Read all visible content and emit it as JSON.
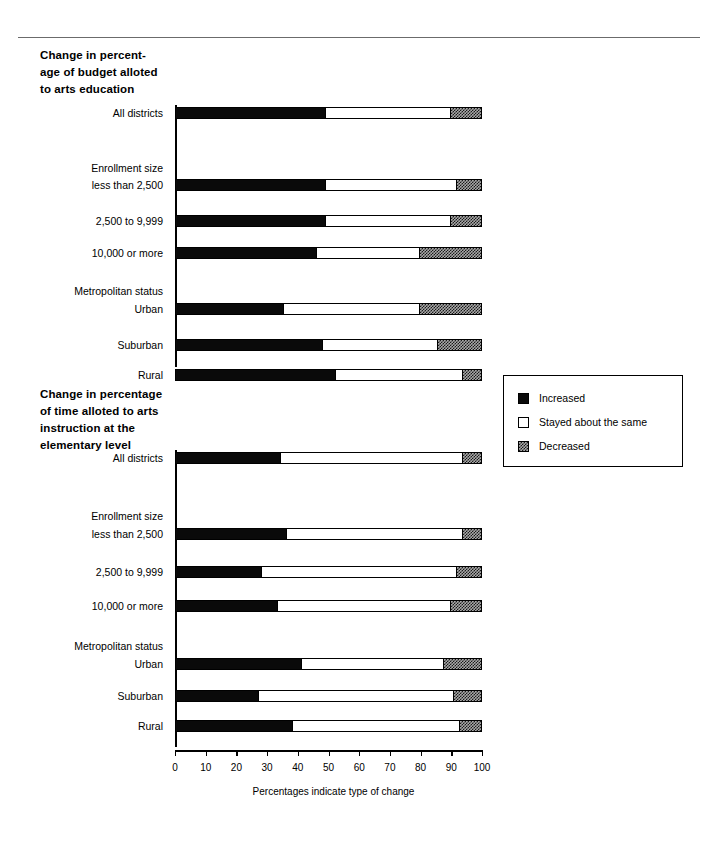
{
  "figure": {
    "xaxis_caption": "Percentages indicate type of change",
    "colors": {
      "increased": "#0a0a0a",
      "stayed": "#ffffff",
      "decreased": "#a8a8a8"
    }
  },
  "legend": {
    "items": [
      {
        "label": "Increased",
        "swatch": "black-square-swatch"
      },
      {
        "label": "Stayed about the same",
        "swatch": "white-square-swatch"
      },
      {
        "label": "Decreased",
        "swatch": "checkered-square-swatch"
      }
    ]
  },
  "chart_data": [
    {
      "type": "bar",
      "orientation": "horizontal",
      "stacked": true,
      "title": "Change in percent-\nage of budget alloted\nto arts education",
      "xlabel": "Percentages indicate type of change",
      "ylabel": "",
      "xlim": [
        0,
        100
      ],
      "xticks": [
        0,
        10,
        20,
        30,
        40,
        50,
        60,
        70,
        80,
        90,
        100
      ],
      "xticklabels": [
        "0",
        "10",
        "20",
        "30",
        "40",
        "50",
        "60",
        "70",
        "80",
        "90",
        "100"
      ],
      "grid": false,
      "legend_position": "right",
      "categories": [
        "All districts",
        "Enrollment size",
        "less than 2,500",
        "2,500 to 9,999",
        "10,000 or more",
        "Metropolitan status",
        "Urban",
        "Suburban",
        "Rural"
      ],
      "group_headers": [
        "Enrollment size",
        "Metropolitan status"
      ],
      "series": [
        {
          "name": "Increased",
          "values": [
            49,
            null,
            49,
            49,
            46,
            null,
            35,
            48,
            52
          ]
        },
        {
          "name": "Stayed about the same",
          "values": [
            41,
            null,
            43,
            41,
            34,
            null,
            45,
            38,
            42
          ]
        },
        {
          "name": "Decreased",
          "values": [
            10,
            null,
            8,
            10,
            20,
            null,
            20,
            14,
            6
          ]
        }
      ]
    },
    {
      "type": "bar",
      "orientation": "horizontal",
      "stacked": true,
      "title": "Change in percentage\nof time alloted to arts\ninstruction at the\nelementary level",
      "xlabel": "Percentages indicate type of change",
      "ylabel": "",
      "xlim": [
        0,
        100
      ],
      "xticks": [
        0,
        10,
        20,
        30,
        40,
        50,
        60,
        70,
        80,
        90,
        100
      ],
      "xticklabels": [
        "0",
        "10",
        "20",
        "30",
        "40",
        "50",
        "60",
        "70",
        "80",
        "90",
        "100"
      ],
      "grid": false,
      "legend_position": "right",
      "categories": [
        "All districts",
        "Enrollment size",
        "less than 2,500",
        "2,500 to 9,999",
        "10,000 or more",
        "Metropolitan status",
        "Urban",
        "Suburban",
        "Rural"
      ],
      "group_headers": [
        "Enrollment size",
        "Metropolitan status"
      ],
      "series": [
        {
          "name": "Increased",
          "values": [
            34,
            null,
            36,
            28,
            33,
            null,
            41,
            27,
            38
          ]
        },
        {
          "name": "Stayed about the same",
          "values": [
            60,
            null,
            58,
            64,
            57,
            null,
            47,
            64,
            55
          ]
        },
        {
          "name": "Decreased",
          "values": [
            6,
            null,
            6,
            8,
            10,
            null,
            12,
            9,
            7
          ]
        }
      ]
    }
  ]
}
